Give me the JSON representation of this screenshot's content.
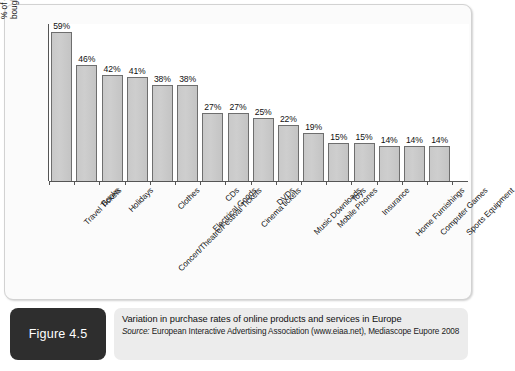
{
  "figure": {
    "tag_label": "Figure 4.5",
    "caption_title": "Variation in purchase rates of online products and services in Europe",
    "source_prefix": "Source:",
    "source_text": " European Interactive Advertising Association (www.eiaa.net), Mediascope Eupore 2008"
  },
  "chart_data": {
    "type": "bar",
    "title": "Variation in purchase rates of online products and services in Europe",
    "xlabel": "",
    "ylabel": "% of online shoppers who bought products/service online",
    "ylabel_lines": [
      "% of online shoppers who",
      "bought products/service online"
    ],
    "ylim": [
      0,
      62
    ],
    "grid": false,
    "legend": "none",
    "value_suffix": "%",
    "categories": [
      "Travel Tickets",
      "Books",
      "Holidays",
      "Concert/Theatre/Festival Tickets",
      "Clothes",
      "Electrical Goods",
      "CDs",
      "Cinema tickets",
      "DVDs",
      "Music Downloads",
      "Mobile Phones",
      "Toys",
      "Insurance",
      "Home Furnishings",
      "Computer Games",
      "Sports Equipment"
    ],
    "values": [
      59,
      46,
      42,
      41,
      38,
      38,
      27,
      27,
      25,
      22,
      19,
      15,
      15,
      14,
      14,
      14
    ],
    "value_labels": [
      "59%",
      "46%",
      "42%",
      "41%",
      "38%",
      "38%",
      "27%",
      "27%",
      "25%",
      "22%",
      "19%",
      "15%",
      "15%",
      "14%",
      "14%",
      "14%"
    ],
    "colors": {
      "bar_fill": "#c9c9c9",
      "bar_border": "#6e6e6e",
      "axis": "#555555",
      "text": "#111111",
      "plot_background": "#ffffff",
      "card_background": "#fbfbfb",
      "caption_background": "#ececec",
      "figure_tag_background": "#2e2e2e"
    }
  }
}
